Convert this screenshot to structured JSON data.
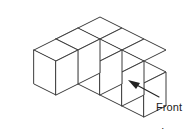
{
  "figure": {
    "type": "isometric-cube-solid-diagram",
    "cube_count": 7,
    "front_row_cubes": 4,
    "back_row_cubes": 3,
    "annotation": {
      "label_line1": "Front",
      "label_line2": "view",
      "label_text": "Front view",
      "arrow": "points up-left to front-right vertical face of the solid"
    },
    "colors": {
      "background": "#ffffff",
      "cube_stroke": "#3c3c3c",
      "cube_fill": "#ffffff",
      "leader_stroke": "#222222",
      "label_text": "#1a1a1a"
    }
  },
  "geometry": {
    "note": "Isometric unit step: +x right-down, +y right-up, +z up",
    "origin_x": 12,
    "origin_y": 62,
    "step_x_dx": 22,
    "step_x_dy": 11,
    "step_y_dx": 22,
    "step_y_dy": -11,
    "cube_height": 34,
    "cells": [
      {
        "col": 0,
        "row": 0
      },
      {
        "col": 1,
        "row": 0
      },
      {
        "col": 2,
        "row": 0
      },
      {
        "col": 3,
        "row": 0
      },
      {
        "col": 1,
        "row": 1
      },
      {
        "col": 2,
        "row": 1
      },
      {
        "col": 3,
        "row": 1
      }
    ]
  }
}
